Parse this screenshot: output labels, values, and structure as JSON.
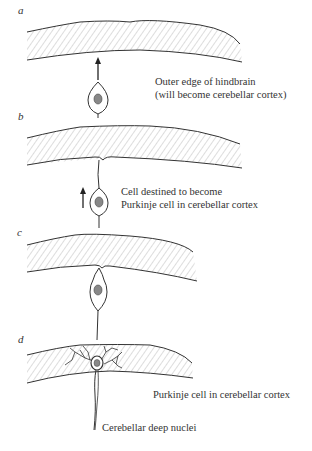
{
  "figure": {
    "panels": [
      {
        "id": "a",
        "label": "a"
      },
      {
        "id": "b",
        "label": "b"
      },
      {
        "id": "c",
        "label": "c"
      },
      {
        "id": "d",
        "label": "d"
      }
    ],
    "annotations": {
      "a_line1": "Outer edge of hindbrain",
      "a_line2": "(will become cerebellar cortex)",
      "b_line1": "Cell destined to become",
      "b_line2": "Purkinje cell in cerebellar cortex",
      "d_purkinje": "Purkinje cell in cerebellar cortex",
      "d_nuclei": "Cerebellar deep nuclei"
    },
    "colors": {
      "ink": "#333333",
      "hatch": "#9a9a9a",
      "nucleus": "#777777"
    }
  }
}
